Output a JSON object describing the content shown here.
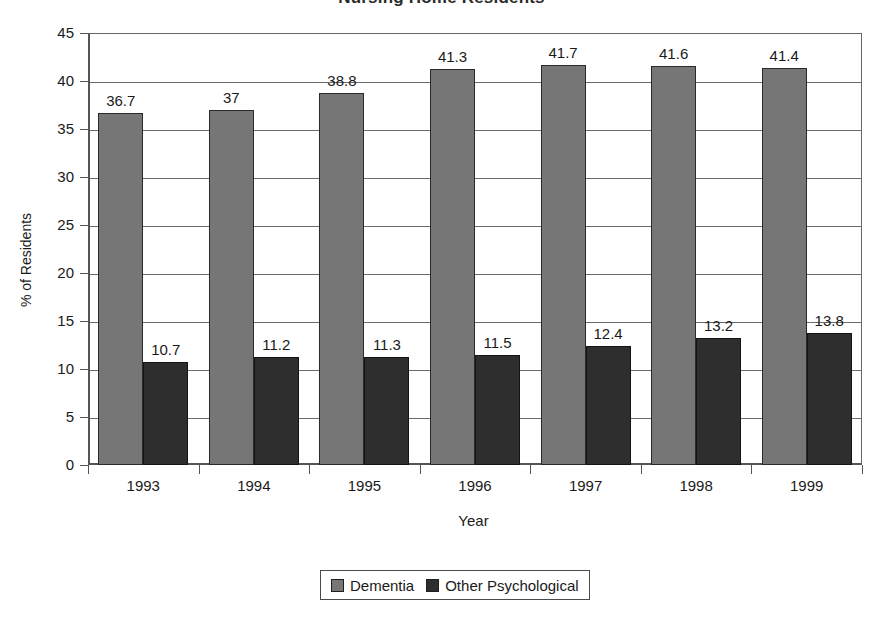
{
  "chart_data": {
    "type": "bar",
    "title": "",
    "xlabel": "Year",
    "ylabel": "% of Residents",
    "ylim": [
      0,
      45
    ],
    "ytick_step": 5,
    "yticks": [
      "0",
      "5",
      "10",
      "15",
      "20",
      "25",
      "30",
      "35",
      "40",
      "45"
    ],
    "grid": true,
    "legend_position": "bottom",
    "categories": [
      "1993",
      "1994",
      "1995",
      "1996",
      "1997",
      "1998",
      "1999"
    ],
    "series": [
      {
        "name": "Dementia",
        "color": "#767676",
        "values": [
          36.7,
          37,
          38.8,
          41.3,
          41.7,
          41.6,
          41.4
        ],
        "labels": [
          "36.7",
          "37",
          "38.8",
          "41.3",
          "41.7",
          "41.6",
          "41.4"
        ]
      },
      {
        "name": "Other Psychological",
        "color": "#2e2e2e",
        "values": [
          10.7,
          11.2,
          11.3,
          11.5,
          12.4,
          13.2,
          13.8
        ],
        "labels": [
          "10.7",
          "11.2",
          "11.3",
          "11.5",
          "12.4",
          "13.2",
          "13.8"
        ]
      }
    ]
  },
  "legend": {
    "items": [
      {
        "label": "Dementia",
        "color": "#767676"
      },
      {
        "label": "Other Psychological",
        "color": "#2e2e2e"
      }
    ]
  },
  "title_remnant": "Nursing Home Residents"
}
